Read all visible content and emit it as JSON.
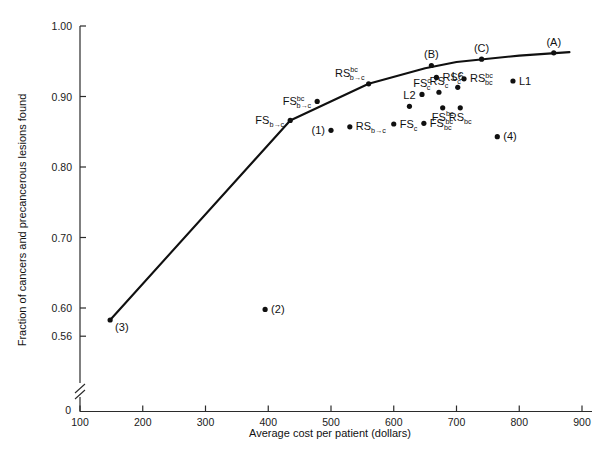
{
  "chart_data": {
    "type": "scatter",
    "title": "",
    "xlabel": "Average cost per patient (dollars)",
    "ylabel": "Fraction of cancers and precancerous lesions found",
    "xlim": [
      100,
      920
    ],
    "ylim": [
      0.555,
      1.0
    ],
    "grid": false,
    "legend": "none",
    "axis_break_y": true,
    "xticks": [
      100,
      200,
      300,
      400,
      500,
      600,
      700,
      800,
      900
    ],
    "xtick_labels": [
      "100",
      "200",
      "300",
      "400",
      "500",
      "600",
      "700",
      "800",
      "900"
    ],
    "yticks": [
      0.56,
      0.6,
      0.7,
      0.8,
      0.9,
      1.0
    ],
    "ytick_labels": [
      "0.56",
      "0.60",
      "0.70",
      "0.80",
      "0.90",
      "1.00"
    ],
    "zero_label": "0",
    "efficient_frontier": {
      "name": "efficient frontier curve",
      "x": [
        148,
        435,
        560,
        650,
        700,
        800,
        880
      ],
      "y": [
        0.583,
        0.866,
        0.918,
        0.94,
        0.949,
        0.958,
        0.963
      ]
    },
    "points": [
      {
        "label": "(3)",
        "base": "(3)",
        "sub": "",
        "sup": "",
        "x": 148,
        "y": 0.583,
        "label_pos": "right-below"
      },
      {
        "label": "(2)",
        "base": "(2)",
        "sub": "",
        "sup": "",
        "x": 395,
        "y": 0.598,
        "label_pos": "right"
      },
      {
        "label": "FS(b->c)",
        "base": "FS",
        "sub": "b→c",
        "sup": "",
        "x": 435,
        "y": 0.866,
        "label_pos": "left"
      },
      {
        "label": "(1)",
        "base": "(1)",
        "sub": "",
        "sup": "",
        "x": 500,
        "y": 0.852,
        "label_pos": "left"
      },
      {
        "label": "FS(b->c)[bc]",
        "base": "FS",
        "sub": "b→c",
        "sup": "bc",
        "x": 478,
        "y": 0.893,
        "label_pos": "left"
      },
      {
        "label": "RS(b->c)",
        "base": "RS",
        "sub": "b→c",
        "sup": "",
        "x": 530,
        "y": 0.857,
        "label_pos": "right"
      },
      {
        "label": "RS(b->c)[bc]",
        "base": "RS",
        "sub": "b→c",
        "sup": "bc",
        "x": 560,
        "y": 0.918,
        "label_pos": "left-above"
      },
      {
        "label": "FS(c)",
        "base": "FS",
        "sub": "c",
        "sup": "",
        "x": 600,
        "y": 0.861,
        "label_pos": "right"
      },
      {
        "label": "L2",
        "base": "L2",
        "sub": "",
        "sup": "",
        "x": 625,
        "y": 0.886,
        "label_pos": "above"
      },
      {
        "label": "FS(c)[c]",
        "base": "FS",
        "sub": "c",
        "sup": "c",
        "x": 645,
        "y": 0.903,
        "label_pos": "above"
      },
      {
        "label": "FS(bc)",
        "base": "FS",
        "sub": "bc",
        "sup": "",
        "x": 648,
        "y": 0.862,
        "label_pos": "right"
      },
      {
        "label": "RS(c)",
        "base": "RS",
        "sub": "c",
        "sup": "",
        "x": 672,
        "y": 0.906,
        "label_pos": "above"
      },
      {
        "label": "RS(c)[c]",
        "base": "RS",
        "sub": "c",
        "sup": "c",
        "x": 668,
        "y": 0.927,
        "label_pos": "right"
      },
      {
        "label": "FS(bc)[bc]",
        "base": "FS",
        "sub": "bc",
        "sup": "bc",
        "x": 678,
        "y": 0.884,
        "label_pos": "below"
      },
      {
        "label": "L6",
        "base": "L6",
        "sub": "",
        "sup": "",
        "x": 702,
        "y": 0.913,
        "label_pos": "above"
      },
      {
        "label": "RS(bc)",
        "base": "RS",
        "sub": "bc",
        "sup": "",
        "x": 706,
        "y": 0.884,
        "label_pos": "below"
      },
      {
        "label": "RS(bc)[bc]",
        "base": "RS",
        "sub": "bc",
        "sup": "bc",
        "x": 712,
        "y": 0.925,
        "label_pos": "right"
      },
      {
        "label": "L1",
        "base": "L1",
        "sub": "",
        "sup": "",
        "x": 790,
        "y": 0.922,
        "label_pos": "right"
      },
      {
        "label": "(4)",
        "base": "(4)",
        "sub": "",
        "sup": "",
        "x": 765,
        "y": 0.843,
        "label_pos": "right"
      },
      {
        "label": "(B)",
        "base": "(B)",
        "sub": "",
        "sup": "",
        "x": 660,
        "y": 0.944,
        "label_pos": "above"
      },
      {
        "label": "(C)",
        "base": "(C)",
        "sub": "",
        "sup": "",
        "x": 740,
        "y": 0.953,
        "label_pos": "above"
      },
      {
        "label": "(A)",
        "base": "(A)",
        "sub": "",
        "sup": "",
        "x": 855,
        "y": 0.962,
        "label_pos": "above"
      }
    ]
  }
}
